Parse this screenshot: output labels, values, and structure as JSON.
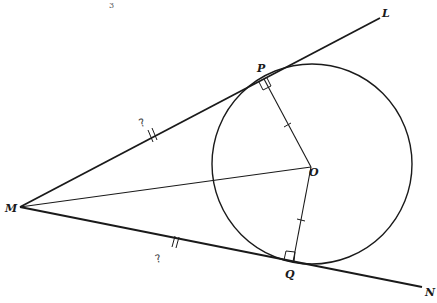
{
  "diagram": {
    "stroke_color": "#1a1a1a",
    "background": "#ffffff",
    "top_mark": "3",
    "points": {
      "M": {
        "label": "M",
        "x": 20,
        "y": 207
      },
      "P": {
        "label": "P",
        "x": 264,
        "y": 79
      },
      "L": {
        "label": "L",
        "x": 380,
        "y": 18
      },
      "O": {
        "label": "O",
        "x": 311,
        "y": 167
      },
      "Q": {
        "label": "Q",
        "x": 293,
        "y": 262
      },
      "N": {
        "label": "N",
        "x": 422,
        "y": 287
      }
    },
    "circle": {
      "cx": 312,
      "cy": 164,
      "r": 100
    },
    "segments": [
      {
        "name": "ML",
        "from": "M",
        "to": "L",
        "note": "tangent line through P"
      },
      {
        "name": "MN",
        "from": "M",
        "to": "N",
        "note": "tangent line through Q"
      },
      {
        "name": "MO",
        "from": "M",
        "to": "O"
      },
      {
        "name": "OP",
        "from": "O",
        "to": "P",
        "tick": "single"
      },
      {
        "name": "OQ",
        "from": "O",
        "to": "Q",
        "tick": "single"
      }
    ],
    "annotations": {
      "MP_tick": "double",
      "MQ_tick": "double",
      "MP_handwritten": "?",
      "MQ_handwritten": "?",
      "right_angle_at": [
        "P",
        "Q"
      ]
    }
  }
}
